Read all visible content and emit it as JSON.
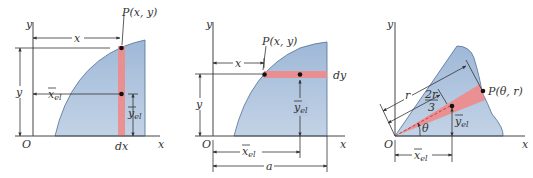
{
  "colors": {
    "region_fill": "#a9c0dc",
    "region_stroke": "#4f6f95",
    "element_fill": "#f08a8a",
    "point": "#111111",
    "line": "#333333"
  },
  "panels": [
    {
      "name": "vertical-strip",
      "labels": {
        "axis_y": "y",
        "axis_x": "x",
        "origin": "O",
        "point": "P(x, y)",
        "dim_x": "x",
        "dim_y": "y",
        "xel": "x",
        "xel_sub": "el",
        "yel": "y",
        "yel_sub": "el",
        "diff": "dx"
      }
    },
    {
      "name": "horizontal-strip",
      "labels": {
        "axis_y": "y",
        "axis_x": "x",
        "origin": "O",
        "point": "P(x, y)",
        "dim_x": "x",
        "dim_y": "y",
        "xel": "x",
        "xel_sub": "el",
        "yel": "y",
        "yel_sub": "el",
        "diff": "dy",
        "width": "a"
      }
    },
    {
      "name": "polar-sector",
      "labels": {
        "axis_y": "y",
        "axis_x": "x",
        "origin": "O",
        "point": "P(θ, r)",
        "radius": "r",
        "two_r": "2r",
        "three": "3",
        "theta": "θ",
        "xel": "x",
        "xel_sub": "el",
        "yel": "y",
        "yel_sub": "el"
      }
    }
  ]
}
